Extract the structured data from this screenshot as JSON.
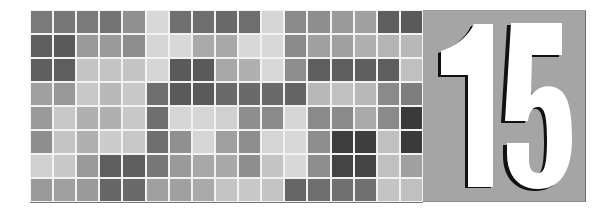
{
  "chapter": {
    "number": "15",
    "panel_color": "#a5a5a5",
    "numeral_color": "#ffffff",
    "shadow_color": "#111111"
  },
  "mosaic": {
    "rows": 8,
    "columns": 17,
    "cells": [
      [
        "#7a7a7a",
        "#777777",
        "#7a7a7a",
        "#747474",
        "#909090",
        "#d8d8d8",
        "#707070",
        "#6e6e6e",
        "#6a6a6a",
        "#6e6e6e",
        "#d5d5d5",
        "#8a8a8a",
        "#8e8e8e",
        "#9a9a9a",
        "#a0a0a0",
        "#5e5e5e",
        "#5a5a5a"
      ],
      [
        "#5e5e5e",
        "#5a5a5a",
        "#9a9a9a",
        "#9a9a9a",
        "#8e8e8e",
        "#d5d5d5",
        "#d8d8d8",
        "#aaaaaa",
        "#a8a8a8",
        "#d8d8d8",
        "#d8d8d8",
        "#8a8a8a",
        "#a0a0a0",
        "#a0a0a0",
        "#b0b0b0",
        "#b4b4b4",
        "#b8b8b8"
      ],
      [
        "#5e5e5e",
        "#5e5e5e",
        "#c4c4c4",
        "#c4c4c4",
        "#c4c4c4",
        "#d5d5d5",
        "#5a5a5a",
        "#5a5a5a",
        "#a8a8a8",
        "#b0b0b0",
        "#d8d8d8",
        "#8e8e8e",
        "#5e5e5e",
        "#5e5e5e",
        "#5e5e5e",
        "#5e5e5e",
        "#c0c0c0"
      ],
      [
        "#a0a0a0",
        "#989898",
        "#c8c8c8",
        "#b8b8b8",
        "#c8c8c8",
        "#6e6e6e",
        "#5a5a5a",
        "#5a5a5a",
        "#6a6a6a",
        "#6a6a6a",
        "#6a6a6a",
        "#646464",
        "#b8b8b8",
        "#c0c0c0",
        "#b8b8b8",
        "#8a8a8a",
        "#7e7e7e"
      ],
      [
        "#9a9a9a",
        "#c8c8c8",
        "#b0b0b0",
        "#b0b0b0",
        "#c8c8c8",
        "#6e6e6e",
        "#d5d5d5",
        "#d5d5d5",
        "#d0d0d0",
        "#8e8e8e",
        "#8a8a8a",
        "#d5d5d5",
        "#8a8a8a",
        "#8a8a8a",
        "#aaaaaa",
        "#8a8a8a",
        "#3a3a3a"
      ],
      [
        "#8e8e8e",
        "#c4c4c4",
        "#b0b0b0",
        "#cccccc",
        "#c8c8c8",
        "#6e6e6e",
        "#909090",
        "#d5d5d5",
        "#a0a0a0",
        "#8e8e8e",
        "#d5d5d5",
        "#d8d8d8",
        "#8e8e8e",
        "#3e3e3e",
        "#3e3e3e",
        "#c0c0c0",
        "#3a3a3a"
      ],
      [
        "#d0d0d0",
        "#c8c8c8",
        "#9a9a9a",
        "#5e5e5e",
        "#5e5e5e",
        "#787878",
        "#9a9a9a",
        "#a8a8a8",
        "#a8a8a8",
        "#8e8e8e",
        "#c4c4c4",
        "#d8d8d8",
        "#8e8e8e",
        "#444444",
        "#444444",
        "#c0c0c0",
        "#a0a0a0"
      ],
      [
        "#9a9a9a",
        "#a0a0a0",
        "#9a9a9a",
        "#666666",
        "#6a6a6a",
        "#a0a0a0",
        "#a0a0a0",
        "#aaaaaa",
        "#c4c4c4",
        "#c8c8c8",
        "#c4c4c4",
        "#666666",
        "#6e6e6e",
        "#707070",
        "#707070",
        "#c4c4c4",
        "#c0c0c0"
      ]
    ]
  }
}
